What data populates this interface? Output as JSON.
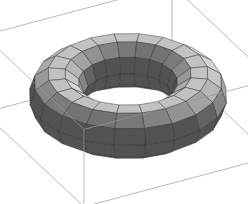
{
  "figure": {
    "kind": "3d-surface-mesh",
    "object_name": "torus",
    "background_color": "#ffffff",
    "mesh_line_color": "#2b2b2b",
    "bounding_box_color": "#9a9a9a",
    "highlight_color": "#e8e8e8",
    "shadow_color": "#333333"
  },
  "geometry": {
    "major_radius": 1.0,
    "minor_radius": 0.38,
    "segments_major": 20,
    "segments_minor": 10,
    "center_hole_color": "#ffffff"
  },
  "camera": {
    "azimuth_deg": -62,
    "elevation_deg": 30,
    "scale": 72,
    "origin_x": 128,
    "origin_y": 96
  },
  "lighting": {
    "light_dir": [
      -0.45,
      -0.55,
      0.72
    ],
    "ambient": 0.2,
    "diffuse": 0.8,
    "min_gray": 44,
    "max_gray": 232
  },
  "bounding_box": {
    "visible": true,
    "half_x": 1.48,
    "half_y": 1.48,
    "half_z": 0.62
  }
}
